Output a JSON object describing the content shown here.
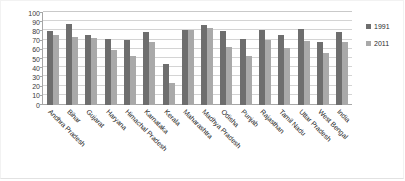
{
  "chart_data": {
    "type": "bar",
    "title": "",
    "subtitle": "",
    "xlabel": "",
    "ylabel": "",
    "ylim": [
      0,
      100
    ],
    "ytick_step": 10,
    "yticks": [
      100,
      90,
      80,
      70,
      60,
      50,
      40,
      30,
      20,
      10,
      0
    ],
    "grid": true,
    "legend_position": "right",
    "categories": [
      "Andhra Pradesh",
      "Bihar",
      "Gujarat",
      "Haryana",
      "Himachal Pradesh",
      "Karnataka",
      "Kerala",
      "Maharashtra",
      "Madhya Pradesh",
      "Odisha",
      "Punjab",
      "Rajasthan",
      "Tamil Nadu",
      "Uttar Pradesh",
      "West Bengal",
      "India"
    ],
    "series": [
      {
        "name": "1991",
        "color": "#6e6e6e",
        "values": [
          80,
          88,
          76,
          72,
          71,
          79,
          45,
          82,
          87,
          80,
          72,
          81,
          76,
          83,
          69,
          79
        ]
      },
      {
        "name": "2011",
        "color": "#a9a9a9",
        "values": [
          76,
          74,
          73,
          60,
          53,
          69,
          24,
          82,
          84,
          63,
          53,
          71,
          62,
          70,
          57,
          69
        ]
      }
    ]
  },
  "legend": {
    "entries": [
      {
        "label": "1991",
        "swatch_name": "legend-swatch-1991"
      },
      {
        "label": "2011",
        "swatch_name": "legend-swatch-2011"
      }
    ]
  }
}
